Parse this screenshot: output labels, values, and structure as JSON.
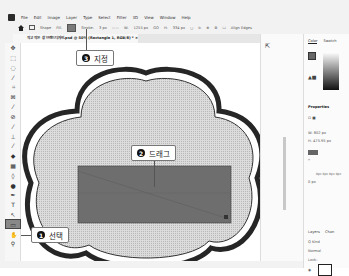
{
  "menubar": {
    "items": [
      "File",
      "Edit",
      "Image",
      "Layer",
      "Type",
      "Select",
      "Filter",
      "3D",
      "View",
      "Window",
      "Help"
    ]
  },
  "options_bar": {
    "mode": "Shape",
    "fill_label": "Fill:",
    "stroke_label": "Stroke:",
    "stroke_width": "3 px",
    "w_label": "W:",
    "w_value": "1255 px",
    "link_label": "GO",
    "h_label": "H:",
    "h_value": "334 px",
    "align_edges": "Align Edges"
  },
  "document_tab": {
    "title": "작고 작은 창 브랜드디자인.psd @ 50% (Rectangle 1, RGB/8) *",
    "close": "×"
  },
  "toolbar": {
    "tools": [
      "move",
      "marquee",
      "lasso",
      "quick-select",
      "crop",
      "frame",
      "eyedropper",
      "healing",
      "brush",
      "clone",
      "history",
      "eraser",
      "gradient",
      "blur",
      "dodge",
      "pen",
      "type",
      "path-select",
      "rectangle",
      "hand",
      "zoom"
    ],
    "active": "rectangle"
  },
  "panels": {
    "color_tab": "Color",
    "swatches_tab": "Swatch",
    "properties_title": "Properties",
    "w_value": "W: 802 px",
    "h_value": "H: 475.95 px",
    "corner_label": "0px 0px 0px 0px",
    "stroke_value": "0 px",
    "layers_tab": "Layers",
    "channels_tab": "Chan",
    "kind_label": "Q Kind",
    "blend_mode": "Normal",
    "lock_label": "Lock:"
  },
  "callouts": {
    "step1": {
      "num": "1",
      "label": "선택"
    },
    "step2": {
      "num": "2",
      "label": "드래그"
    },
    "step3": {
      "num": "3",
      "label": "지정"
    }
  },
  "colors": {
    "rect_fill": "#6e6e6e",
    "shape_outline": "#2a2a2a",
    "shape_fill": "#d4d4d4"
  }
}
